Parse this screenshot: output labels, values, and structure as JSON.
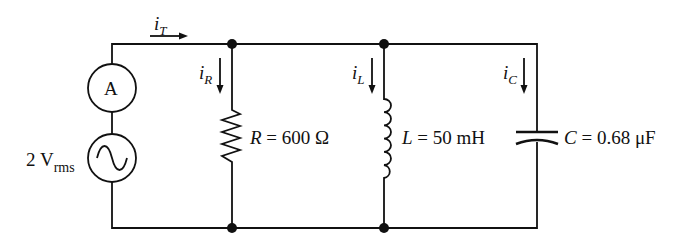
{
  "circuit": {
    "type": "parallel RLC",
    "source": {
      "value": "2 V",
      "subscript": "rms",
      "symbol": "ac-sine"
    },
    "ammeter": {
      "label": "A"
    },
    "resistor": {
      "var": "R",
      "value": "= 600 Ω"
    },
    "inductor": {
      "var": "L",
      "value": "= 50 mH"
    },
    "capacitor": {
      "var": "C",
      "value": "= 0.68 μF"
    },
    "currents": {
      "total": {
        "base": "i",
        "sub": "T"
      },
      "resistor": {
        "base": "i",
        "sub": "R"
      },
      "inductor": {
        "base": "i",
        "sub": "L"
      },
      "capacitor": {
        "base": "i",
        "sub": "C"
      }
    }
  },
  "colors": {
    "stroke": "#111111",
    "background": "#ffffff"
  }
}
